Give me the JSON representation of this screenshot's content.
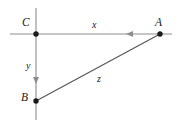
{
  "figure": {
    "type": "geometry-diagram",
    "background_color": "#ffffff",
    "canvas": {
      "width": 178,
      "height": 124
    },
    "colors": {
      "axis": "#8d8d8d",
      "segment": "#595959",
      "vertex": "#1a1a1a",
      "label": "#1a1a1a"
    },
    "axes": {
      "horizontal": {
        "y": 34,
        "x_start": 10,
        "x_end": 172
      },
      "vertical": {
        "x": 36,
        "y_start": 8,
        "y_end": 120
      }
    },
    "vertices": [
      {
        "name": "C",
        "label": "C",
        "x": 36,
        "y": 34,
        "label_x": 22,
        "label_y": 19
      },
      {
        "name": "A",
        "label": "A",
        "x": 160,
        "y": 34,
        "label_x": 155,
        "label_y": 19
      },
      {
        "name": "B",
        "label": "B",
        "x": 36,
        "y": 101,
        "label_x": 22,
        "label_y": 92
      }
    ],
    "segments": [
      {
        "name": "CA",
        "label": "x",
        "from": "C",
        "to": "A",
        "label_x": 92,
        "label_y": 21
      },
      {
        "name": "CB",
        "label": "y",
        "from": "C",
        "to": "B",
        "label_x": 26,
        "label_y": 61
      },
      {
        "name": "BA",
        "label": "z",
        "from": "B",
        "to": "A",
        "label_x": 97,
        "label_y": 74
      }
    ],
    "arrows": [
      {
        "name": "x-direction-arrow",
        "on": "horizontal",
        "x": 131,
        "y": 34,
        "direction": "left"
      },
      {
        "name": "y-direction-arrow",
        "on": "vertical",
        "x": 36,
        "y": 80,
        "direction": "down"
      }
    ]
  }
}
